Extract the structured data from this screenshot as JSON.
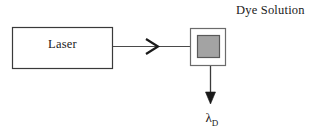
{
  "figure": {
    "background_color": "#ffffff",
    "stroke_color": "#3a3a3a",
    "dark_stroke_color": "#1a1a1a",
    "cuvette_fill_color": "#a3a3a3",
    "cuvette_border_color": "#595959"
  },
  "laser_box": {
    "label": "Laser"
  },
  "beam": {
    "arrowhead_glyph": "chevron-right"
  },
  "cuvette": {
    "caption": "Dye Solution"
  },
  "emission": {
    "symbol": "λ",
    "subscript": "D"
  }
}
